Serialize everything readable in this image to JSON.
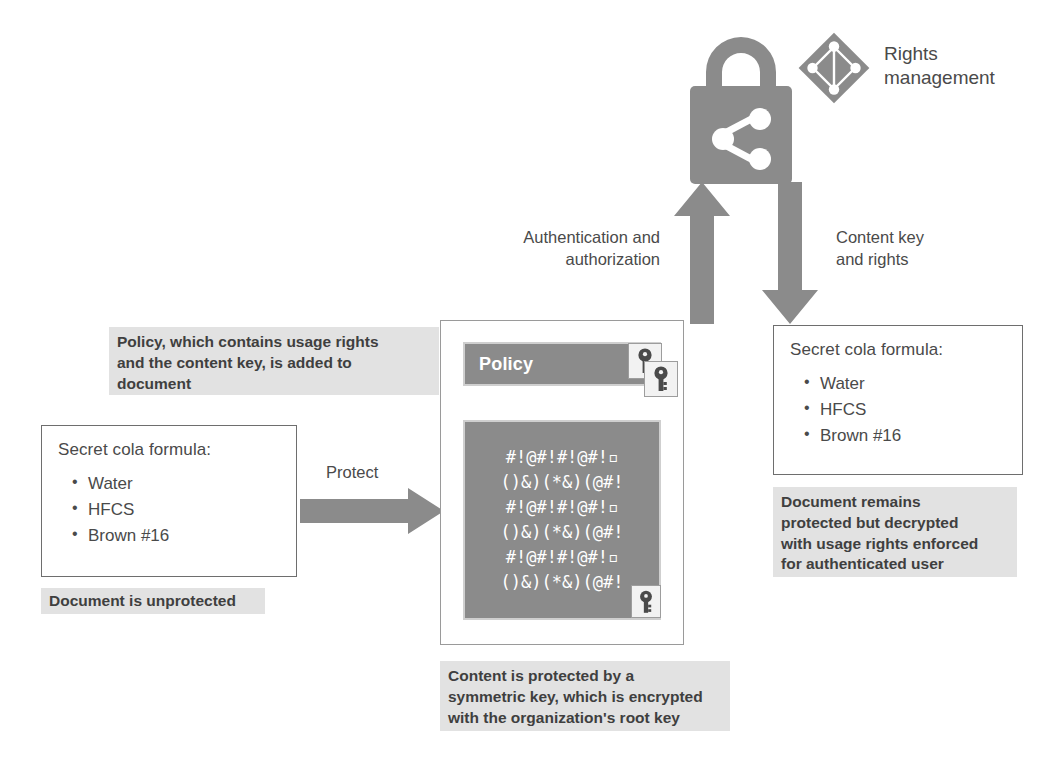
{
  "diagram": {
    "colors": {
      "gray_fill": "#8b8b8b",
      "callout_bg": "#e2e2e2",
      "card_border": "#6e6e6e",
      "arrow": "#8b8b8b",
      "text": "#4a4a4a"
    }
  },
  "rights_management": {
    "label_line1": "Rights",
    "label_line2": "management",
    "lock_icon": "lock-with-share-icon",
    "service_icon": "azure-rights-management-diamond-icon"
  },
  "flows": {
    "up": {
      "line1": "Authentication and",
      "line2": "authorization",
      "direction": "up"
    },
    "down": {
      "line1": "Content key",
      "line2": "and rights",
      "direction": "down"
    },
    "protect": {
      "label": "Protect",
      "direction": "right"
    }
  },
  "unprotected_document": {
    "title": "Secret cola formula:",
    "items": [
      "Water",
      "HFCS",
      "Brown #16"
    ],
    "caption": "Document is unprotected"
  },
  "protected_document": {
    "policy_label": "Policy",
    "cipher_lines": [
      "#!@#!#!@#!▫",
      "()&)(*&)(@#!",
      "#!@#!#!@#!▫",
      "()&)(*&)(@#!",
      "#!@#!#!@#!▫",
      "()&)(*&)(@#!"
    ],
    "key_icon_policy": "key-icon",
    "key_icon_policy_secondary": "key-icon",
    "key_icon_content": "key-icon",
    "callout_top": {
      "line1": "Policy, which contains usage rights",
      "line2": "and the content key, is added to",
      "line3": "document"
    },
    "callout_bottom": {
      "line1": "Content is protected by a",
      "line2": "symmetric key, which is encrypted",
      "line3": "with the organization's root key"
    }
  },
  "consumed_document": {
    "title": "Secret cola formula:",
    "items": [
      "Water",
      "HFCS",
      "Brown #16"
    ],
    "callout": {
      "line1": "Document remains",
      "line2": "protected but decrypted",
      "line3": "with usage rights enforced",
      "line4": "for authenticated user"
    }
  }
}
